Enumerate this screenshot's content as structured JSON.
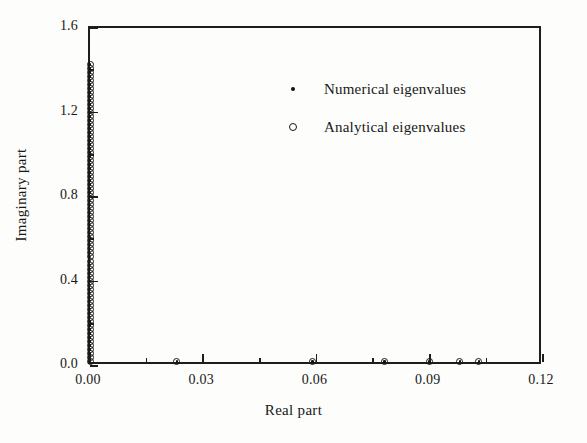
{
  "chart_data": {
    "type": "scatter",
    "title": "",
    "xlabel": "Real part",
    "ylabel": "Imaginary part",
    "xlim": [
      0.0,
      0.12
    ],
    "ylim": [
      0.0,
      1.6
    ],
    "xticks": [
      0.0,
      0.03,
      0.06,
      0.09,
      0.12
    ],
    "xtick_labels": [
      "0.00",
      "0.03",
      "0.06",
      "0.09",
      "0.12"
    ],
    "xminor_ticks": [
      0.015,
      0.045,
      0.075,
      0.105
    ],
    "yticks": [
      0.0,
      0.4,
      0.8,
      1.2,
      1.6
    ],
    "ytick_labels": [
      "0.0",
      "0.4",
      "0.8",
      "1.2",
      "1.6"
    ],
    "yminor_ticks": [
      0.2,
      0.6,
      1.0,
      1.4
    ],
    "grid": false,
    "legend_position": "upper center-right",
    "series": [
      {
        "name": "Numerical eigenvalues",
        "marker": "filled-dot",
        "points": [
          [
            0.0,
            0.022
          ],
          [
            0.0,
            0.041
          ],
          [
            0.0,
            0.06
          ],
          [
            0.0,
            0.079
          ],
          [
            0.0,
            0.098
          ],
          [
            0.0,
            0.117
          ],
          [
            0.0,
            0.136
          ],
          [
            0.0,
            0.155
          ],
          [
            0.0,
            0.174
          ],
          [
            0.0,
            0.193
          ],
          [
            0.0,
            0.212
          ],
          [
            0.0,
            0.231
          ],
          [
            0.0,
            0.25
          ],
          [
            0.0,
            0.269
          ],
          [
            0.0,
            0.288
          ],
          [
            0.0,
            0.307
          ],
          [
            0.0,
            0.326
          ],
          [
            0.0,
            0.345
          ],
          [
            0.0,
            0.364
          ],
          [
            0.0,
            0.383
          ],
          [
            0.0,
            0.402
          ],
          [
            0.0,
            0.421
          ],
          [
            0.0,
            0.44
          ],
          [
            0.0,
            0.459
          ],
          [
            0.0,
            0.478
          ],
          [
            0.0,
            0.497
          ],
          [
            0.0,
            0.516
          ],
          [
            0.0,
            0.535
          ],
          [
            0.0,
            0.554
          ],
          [
            0.0,
            0.573
          ],
          [
            0.0,
            0.592
          ],
          [
            0.0,
            0.611
          ],
          [
            0.0,
            0.63
          ],
          [
            0.0,
            0.649
          ],
          [
            0.0,
            0.668
          ],
          [
            0.0,
            0.687
          ],
          [
            0.0,
            0.706
          ],
          [
            0.0,
            0.725
          ],
          [
            0.0,
            0.744
          ],
          [
            0.0,
            0.763
          ],
          [
            0.0,
            0.782
          ],
          [
            0.0,
            0.801
          ],
          [
            0.0,
            0.82
          ],
          [
            0.0,
            0.839
          ],
          [
            0.0,
            0.858
          ],
          [
            0.0,
            0.877
          ],
          [
            0.0,
            0.896
          ],
          [
            0.0,
            0.915
          ],
          [
            0.0,
            0.934
          ],
          [
            0.0,
            0.953
          ],
          [
            0.0,
            0.972
          ],
          [
            0.0,
            0.991
          ],
          [
            0.0,
            1.01
          ],
          [
            0.0,
            1.029
          ],
          [
            0.0,
            1.048
          ],
          [
            0.0,
            1.067
          ],
          [
            0.0,
            1.086
          ],
          [
            0.0,
            1.105
          ],
          [
            0.0,
            1.124
          ],
          [
            0.0,
            1.143
          ],
          [
            0.0,
            1.162
          ],
          [
            0.0,
            1.181
          ],
          [
            0.0,
            1.2
          ],
          [
            0.0,
            1.219
          ],
          [
            0.0,
            1.238
          ],
          [
            0.0,
            1.257
          ],
          [
            0.0,
            1.276
          ],
          [
            0.0,
            1.295
          ],
          [
            0.0,
            1.314
          ],
          [
            0.0,
            1.333
          ],
          [
            0.0,
            1.352
          ],
          [
            0.0,
            1.371
          ],
          [
            0.0,
            1.39
          ],
          [
            0.0,
            1.409
          ],
          [
            0.0,
            1.428
          ],
          [
            0.023,
            0.022
          ],
          [
            0.059,
            0.022
          ],
          [
            0.078,
            0.022
          ],
          [
            0.09,
            0.022
          ],
          [
            0.098,
            0.022
          ],
          [
            0.103,
            0.022
          ]
        ]
      },
      {
        "name": "Analytical eigenvalues",
        "marker": "open-circle",
        "points": [
          [
            0.0,
            0.022
          ],
          [
            0.0,
            0.041
          ],
          [
            0.0,
            0.06
          ],
          [
            0.0,
            0.079
          ],
          [
            0.0,
            0.098
          ],
          [
            0.0,
            0.117
          ],
          [
            0.0,
            0.136
          ],
          [
            0.0,
            0.155
          ],
          [
            0.0,
            0.174
          ],
          [
            0.0,
            0.193
          ],
          [
            0.0,
            0.212
          ],
          [
            0.0,
            0.231
          ],
          [
            0.0,
            0.25
          ],
          [
            0.0,
            0.269
          ],
          [
            0.0,
            0.288
          ],
          [
            0.0,
            0.307
          ],
          [
            0.0,
            0.326
          ],
          [
            0.0,
            0.345
          ],
          [
            0.0,
            0.364
          ],
          [
            0.0,
            0.383
          ],
          [
            0.0,
            0.402
          ],
          [
            0.0,
            0.421
          ],
          [
            0.0,
            0.44
          ],
          [
            0.0,
            0.459
          ],
          [
            0.0,
            0.478
          ],
          [
            0.0,
            0.497
          ],
          [
            0.0,
            0.516
          ],
          [
            0.0,
            0.535
          ],
          [
            0.0,
            0.554
          ],
          [
            0.0,
            0.573
          ],
          [
            0.0,
            0.592
          ],
          [
            0.0,
            0.611
          ],
          [
            0.0,
            0.63
          ],
          [
            0.0,
            0.649
          ],
          [
            0.0,
            0.668
          ],
          [
            0.0,
            0.687
          ],
          [
            0.0,
            0.706
          ],
          [
            0.0,
            0.725
          ],
          [
            0.0,
            0.744
          ],
          [
            0.0,
            0.763
          ],
          [
            0.0,
            0.782
          ],
          [
            0.0,
            0.801
          ],
          [
            0.0,
            0.82
          ],
          [
            0.0,
            0.839
          ],
          [
            0.0,
            0.858
          ],
          [
            0.0,
            0.877
          ],
          [
            0.0,
            0.896
          ],
          [
            0.0,
            0.915
          ],
          [
            0.0,
            0.934
          ],
          [
            0.0,
            0.953
          ],
          [
            0.0,
            0.972
          ],
          [
            0.0,
            0.991
          ],
          [
            0.0,
            1.01
          ],
          [
            0.0,
            1.029
          ],
          [
            0.0,
            1.048
          ],
          [
            0.0,
            1.067
          ],
          [
            0.0,
            1.086
          ],
          [
            0.0,
            1.105
          ],
          [
            0.0,
            1.124
          ],
          [
            0.0,
            1.143
          ],
          [
            0.0,
            1.162
          ],
          [
            0.0,
            1.181
          ],
          [
            0.0,
            1.2
          ],
          [
            0.0,
            1.219
          ],
          [
            0.0,
            1.238
          ],
          [
            0.0,
            1.257
          ],
          [
            0.0,
            1.276
          ],
          [
            0.0,
            1.295
          ],
          [
            0.0,
            1.314
          ],
          [
            0.0,
            1.333
          ],
          [
            0.0,
            1.352
          ],
          [
            0.0,
            1.371
          ],
          [
            0.0,
            1.39
          ],
          [
            0.0,
            1.409
          ],
          [
            0.0,
            1.428
          ],
          [
            0.023,
            0.022
          ],
          [
            0.059,
            0.022
          ],
          [
            0.078,
            0.022
          ],
          [
            0.09,
            0.022
          ],
          [
            0.098,
            0.022
          ],
          [
            0.103,
            0.022
          ]
        ]
      }
    ]
  },
  "legend": {
    "entries": [
      {
        "label": "Numerical eigenvalues",
        "marker": "filled-dot"
      },
      {
        "label": "Analytical eigenvalues",
        "marker": "open-circle"
      }
    ]
  },
  "colors": {
    "ink": "#181818",
    "frame": "#1d1d1d",
    "paper": "#fdfdfb"
  }
}
